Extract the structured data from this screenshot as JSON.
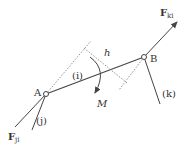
{
  "diagram": {
    "points": {
      "A": {
        "label": "A",
        "x": 46,
        "y": 94
      },
      "B": {
        "label": "B",
        "x": 144,
        "y": 57
      }
    },
    "labels": {
      "member_i": "(i)",
      "member_j": "(j)",
      "member_k": "(k)",
      "distance": "h",
      "moment": "M",
      "force_ki_main": "F",
      "force_ki_sub": "ki",
      "force_ji_main": "F",
      "force_ji_sub": "ji"
    },
    "colors": {
      "line": "#444444",
      "dashed": "#777777",
      "text": "#333333"
    }
  }
}
